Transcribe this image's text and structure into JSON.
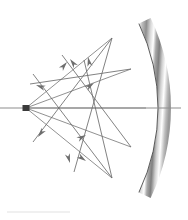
{
  "figure": {
    "kind": "optics-ray-diagram",
    "canvas": {
      "width": 188,
      "height": 220,
      "background": "#ffffff"
    }
  },
  "colors": {
    "ray": "#7d7d7d",
    "ray_dark": "#6b6b6b",
    "arrowhead": "#6e6e6e",
    "axis": "#8d8d8d",
    "mirror_edge": "#4a4a4a",
    "mirror_light": "#ffffff",
    "mirror_mid": "#c9c9c9",
    "mirror_dark": "#8a8a8a",
    "source": "#3a3a3a",
    "rule": "#e2e2e2"
  },
  "optical_axis": {
    "name": "optical-axis",
    "x1": 0,
    "y1": 108,
    "x2": 181,
    "y2": 108,
    "stroke_width": 1.1
  },
  "source_point": {
    "name": "point-source",
    "x": 26,
    "y": 108,
    "width": 7,
    "height": 6
  },
  "mirror": {
    "name": "concave-mirror-arc",
    "center_x": -38,
    "center_y": 108,
    "radius_inner": 196,
    "band_width": 13,
    "start_angle_deg": -25.5,
    "end_angle_deg": 25.5,
    "gradient_stops": [
      {
        "offset": 0.0,
        "color": "#ffffff"
      },
      {
        "offset": 0.1,
        "color": "#bdbdbd"
      },
      {
        "offset": 0.22,
        "color": "#8f8f8f"
      },
      {
        "offset": 0.34,
        "color": "#d8d8d8"
      },
      {
        "offset": 0.44,
        "color": "#ffffff"
      },
      {
        "offset": 0.52,
        "color": "#a8a8a8"
      },
      {
        "offset": 0.62,
        "color": "#7f7f7f"
      },
      {
        "offset": 0.72,
        "color": "#cfcfcf"
      },
      {
        "offset": 0.82,
        "color": "#ffffff"
      },
      {
        "offset": 0.92,
        "color": "#bcbcbc"
      },
      {
        "offset": 1.0,
        "color": "#9a9a9a"
      }
    ]
  },
  "incident_rays": [
    {
      "name": "incident-ray-1",
      "x1": 26,
      "y1": 108,
      "x2": 112,
      "y2": 38,
      "label": "up-steep"
    },
    {
      "name": "incident-ray-2",
      "x1": 26,
      "y1": 108,
      "x2": 131,
      "y2": 69,
      "label": "up-shallow"
    },
    {
      "name": "incident-ray-3",
      "x1": 26,
      "y1": 108,
      "x2": 146,
      "y2": 108,
      "label": "axial"
    },
    {
      "name": "incident-ray-4",
      "x1": 26,
      "y1": 108,
      "x2": 131,
      "y2": 147,
      "label": "down-shallow"
    },
    {
      "name": "incident-ray-5",
      "x1": 26,
      "y1": 108,
      "x2": 112,
      "y2": 178,
      "label": "down-steep"
    }
  ],
  "reflected_rays": [
    {
      "name": "reflected-ray-1",
      "x1": 112,
      "y1": 38,
      "x2": 33,
      "y2": 142,
      "arrow_deg": 127
    },
    {
      "name": "reflected-ray-2",
      "x1": 131,
      "y1": 69,
      "x2": 30,
      "y2": 84,
      "arrow_deg": 188
    },
    {
      "name": "reflected-ray-3",
      "x1": 112,
      "y1": 178,
      "x2": 33,
      "y2": 74,
      "arrow_deg": 233
    },
    {
      "name": "reflected-ray-4",
      "x1": 131,
      "y1": 147,
      "x2": 62,
      "y2": 55,
      "arrow_deg": 233
    },
    {
      "name": "reflected-ray-5",
      "x1": 112,
      "y1": 38,
      "x2": 74,
      "y2": 172,
      "arrow_deg": 74
    },
    {
      "name": "reflected-ray-6",
      "x1": 112,
      "y1": 178,
      "x2": 84,
      "y2": 60,
      "arrow_deg": 257
    }
  ],
  "arrowheads": [
    {
      "name": "arrowhead-upleft-1",
      "x": 36,
      "y": 85,
      "angle_deg": 200
    },
    {
      "name": "arrowhead-upleft-2",
      "x": 70,
      "y": 59,
      "angle_deg": 233
    },
    {
      "name": "arrowhead-up-1",
      "x": 88,
      "y": 57,
      "angle_deg": 258
    },
    {
      "name": "arrowhead-upright-1",
      "x": 67,
      "y": 62,
      "angle_deg": 310
    },
    {
      "name": "arrowhead-right-1",
      "x": 94,
      "y": 83,
      "angle_deg": 325
    },
    {
      "name": "arrowhead-right-2",
      "x": 86,
      "y": 135,
      "angle_deg": 332
    },
    {
      "name": "arrowhead-downleft-1",
      "x": 38,
      "y": 137,
      "angle_deg": 127
    },
    {
      "name": "arrowhead-down-1",
      "x": 70,
      "y": 163,
      "angle_deg": 74
    },
    {
      "name": "arrowhead-downright-1",
      "x": 86,
      "y": 161,
      "angle_deg": 35
    }
  ],
  "bottom_rule": {
    "name": "bottom-rule",
    "x1": 7,
    "y1": 212,
    "x2": 70,
    "y2": 212,
    "stroke_width": 1.2
  }
}
